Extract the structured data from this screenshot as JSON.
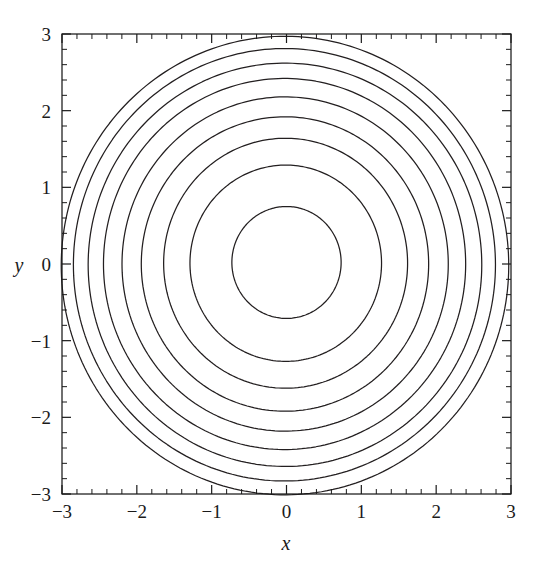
{
  "figure": {
    "background_color": "#ffffff",
    "line_color": "#231f20",
    "axis_color": "#1a1a1a"
  },
  "axes": {
    "x_title": "x",
    "y_title": "y",
    "x_ticklabels": [
      "−3",
      "−2",
      "−1",
      "0",
      "1",
      "2",
      "3"
    ],
    "y_ticklabels": [
      "3",
      "2",
      "1",
      "0",
      "−1",
      "−2",
      "−3"
    ]
  },
  "chart_data": {
    "type": "line",
    "plot_kind": "contour",
    "title": "",
    "xlabel": "x",
    "ylabel": "y",
    "xlim": [
      -3,
      3
    ],
    "ylim": [
      -3,
      3
    ],
    "xticks": [
      -3,
      -2,
      -1,
      0,
      1,
      2,
      3
    ],
    "yticks": [
      -3,
      -2,
      -1,
      0,
      1,
      2,
      3
    ],
    "xtick_labels": [
      "−3",
      "−2",
      "−1",
      "0",
      "1",
      "2",
      "3"
    ],
    "ytick_labels": [
      "−3",
      "−2",
      "−1",
      "0",
      "1",
      "2",
      "3"
    ],
    "minor_tick_step": 0.2,
    "grid": false,
    "legend": null,
    "legend_position": "none",
    "annotations": [],
    "contour_count": 9,
    "contours": [
      {
        "index": 1,
        "mean_radius": 0.73,
        "center_x": 0.0,
        "center_y": 0.02,
        "elongation": 1.0,
        "tilt_deg": 0
      },
      {
        "index": 2,
        "mean_radius": 1.28,
        "center_x": -0.01,
        "center_y": 0.01,
        "elongation": 1.0,
        "tilt_deg": 0
      },
      {
        "index": 3,
        "mean_radius": 1.63,
        "center_x": -0.02,
        "center_y": 0.01,
        "elongation": 1.01,
        "tilt_deg": 0
      },
      {
        "index": 4,
        "mean_radius": 1.92,
        "center_x": -0.03,
        "center_y": 0.0,
        "elongation": 1.01,
        "tilt_deg": 0
      },
      {
        "index": 5,
        "mean_radius": 2.18,
        "center_x": -0.04,
        "center_y": 0.0,
        "elongation": 1.02,
        "tilt_deg": 0
      },
      {
        "index": 6,
        "mean_radius": 2.42,
        "center_x": -0.05,
        "center_y": 0.0,
        "elongation": 1.02,
        "tilt_deg": 0
      },
      {
        "index": 7,
        "mean_radius": 2.63,
        "center_x": -0.06,
        "center_y": -0.01,
        "elongation": 1.03,
        "tilt_deg": 0
      },
      {
        "index": 8,
        "mean_radius": 2.82,
        "center_x": -0.07,
        "center_y": -0.01,
        "elongation": 1.03,
        "tilt_deg": 0
      },
      {
        "index": 9,
        "mean_radius": 2.99,
        "center_x": -0.08,
        "center_y": -0.02,
        "elongation": 1.04,
        "tilt_deg": 0
      }
    ],
    "series": [
      {
        "name": "contour-1",
        "radius": 0.73
      },
      {
        "name": "contour-2",
        "radius": 1.28
      },
      {
        "name": "contour-3",
        "radius": 1.63
      },
      {
        "name": "contour-4",
        "radius": 1.92
      },
      {
        "name": "contour-5",
        "radius": 2.18
      },
      {
        "name": "contour-6",
        "radius": 2.42
      },
      {
        "name": "contour-7",
        "radius": 2.63
      },
      {
        "name": "contour-8",
        "radius": 2.82
      },
      {
        "name": "contour-9",
        "radius": 2.99
      }
    ]
  }
}
